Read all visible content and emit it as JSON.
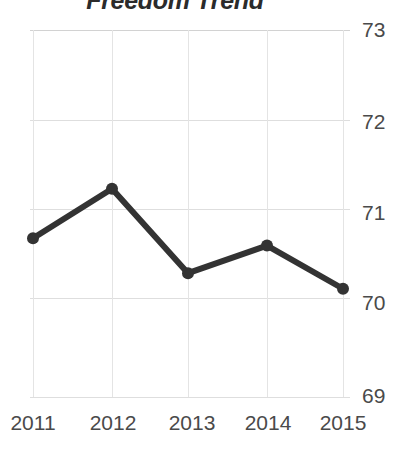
{
  "chart_data": {
    "type": "line",
    "title": "Freedom Trend",
    "subtitle": "",
    "xlabel": "",
    "ylabel": "",
    "categories": [
      "2011",
      "2012",
      "2013",
      "2014",
      "2015"
    ],
    "values": [
      70.73,
      71.27,
      70.35,
      70.65,
      70.18
    ],
    "series": [
      {
        "name": "Freedom Trend",
        "values": [
          70.73,
          71.27,
          70.35,
          70.65,
          70.18
        ]
      }
    ],
    "x_tick_labels": [
      "2011",
      "2012",
      "2013",
      "2014",
      "2015"
    ],
    "y_tick_labels": [
      "73",
      "72",
      "71",
      "70",
      "69"
    ],
    "y_ticks": [
      73,
      72,
      71,
      70,
      69
    ],
    "ylim": [
      69,
      73
    ],
    "xlim": [
      "2011",
      "2015"
    ],
    "grid": true,
    "grid_axis": "both",
    "legend": false,
    "legend_position": "none",
    "markers": true,
    "marker_shape": "circle",
    "line_color": "#333333",
    "marker_color": "#333333",
    "grid_color": "#dedede",
    "tick_label_color": "#4a4a4a",
    "title_color": "#2b2b2b",
    "background_color": "#ffffff",
    "y_axis_side": "right",
    "annotations": []
  },
  "axis": {
    "y_labels": [
      {
        "text": "73",
        "top": 19
      },
      {
        "text": "72",
        "top": 111
      },
      {
        "text": "71",
        "top": 202
      },
      {
        "text": "70",
        "top": 292
      },
      {
        "text": "69",
        "top": 385
      }
    ],
    "x_labels": [
      {
        "text": "2011",
        "left": -7
      },
      {
        "text": "2012",
        "left": 73
      },
      {
        "text": "2013",
        "left": 152
      },
      {
        "text": "2014",
        "left": 228
      },
      {
        "text": "2015",
        "left": 303
      }
    ]
  }
}
